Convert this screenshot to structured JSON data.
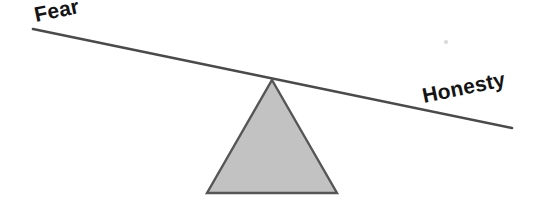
{
  "diagram": {
    "type": "balance-scale",
    "background_color": "#ffffff",
    "beam": {
      "name": "lever-beam",
      "color": "#4a4a4a",
      "thickness_px": 2.6,
      "left_point": {
        "x": 33,
        "y": 29
      },
      "right_point": {
        "x": 512,
        "y": 128
      },
      "tilt_degrees": 11.7,
      "tilted_toward": "Honesty"
    },
    "fulcrum": {
      "name": "triangle-fulcrum",
      "fill_color": "#c2c2c2",
      "outline_color": "#565656",
      "apex": {
        "x": 272,
        "y": 80
      },
      "base_left": {
        "x": 207,
        "y": 193
      },
      "base_right": {
        "x": 337,
        "y": 193
      }
    },
    "labels": {
      "left": {
        "text": "Fear",
        "position": "upper-left",
        "rotation_degrees": -11.7,
        "x": 36,
        "y": 22,
        "color": "#141414"
      },
      "right": {
        "text": "Honesty",
        "position": "lower-right",
        "rotation_degrees": -11.7,
        "x": 424,
        "y": 103,
        "color": "#141414"
      }
    }
  }
}
